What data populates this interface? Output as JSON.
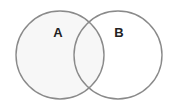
{
  "diagram": {
    "type": "venn",
    "sets": [
      {
        "label": "A",
        "cx": 60,
        "cy": 55,
        "r": 44
      },
      {
        "label": "B",
        "cx": 118,
        "cy": 55,
        "r": 44
      }
    ],
    "colors": {
      "stroke": "#8a8a8a",
      "fill": "#f6f6f6",
      "text": "#222222"
    }
  }
}
